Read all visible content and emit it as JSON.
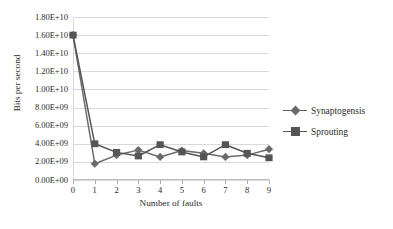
{
  "chart_data": {
    "type": "line",
    "title": "",
    "xlabel": "Number of faults",
    "ylabel": "Bits per second",
    "x": [
      0,
      1,
      2,
      3,
      4,
      5,
      6,
      7,
      8,
      9
    ],
    "categories": [
      "0",
      "1",
      "2",
      "3",
      "4",
      "5",
      "6",
      "7",
      "8",
      "9"
    ],
    "series": [
      {
        "name": "Synaptogensis",
        "marker": "diamond",
        "color": "#6b6b6b",
        "values": [
          16000000000,
          1800000000,
          2750000000,
          3300000000,
          2550000000,
          3250000000,
          2950000000,
          2550000000,
          2750000000,
          3400000000
        ]
      },
      {
        "name": "Sprouting",
        "marker": "square",
        "color": "#555555",
        "values": [
          16000000000,
          4000000000,
          3050000000,
          2650000000,
          3900000000,
          3100000000,
          2550000000,
          3900000000,
          2950000000,
          2450000000
        ]
      }
    ],
    "ylim": [
      0,
      18000000000
    ],
    "xlim": [
      0,
      9
    ],
    "ytick_labels": [
      "0.00E+00",
      "2.00E+09",
      "4.00E+09",
      "6.00E+09",
      "8.00E+09",
      "1.00E+10",
      "1.20E+10",
      "1.40E+10",
      "1.60E+10",
      "1.80E+10"
    ],
    "ytick_values": [
      0,
      2000000000,
      4000000000,
      6000000000,
      8000000000,
      10000000000,
      12000000000,
      14000000000,
      16000000000,
      18000000000
    ],
    "xtick_labels": [
      "0",
      "1",
      "2",
      "3",
      "4",
      "5",
      "6",
      "7",
      "8",
      "9"
    ],
    "grid": "horizontal",
    "legend_position": "right",
    "background": "#ffffff",
    "gridline_color": "#d9d9d9"
  },
  "legend": {
    "entries": [
      {
        "label": "Synaptogensis"
      },
      {
        "label": "Sprouting"
      }
    ]
  },
  "axes": {
    "x_title": "Number of faults",
    "y_title": "Bits per second"
  }
}
